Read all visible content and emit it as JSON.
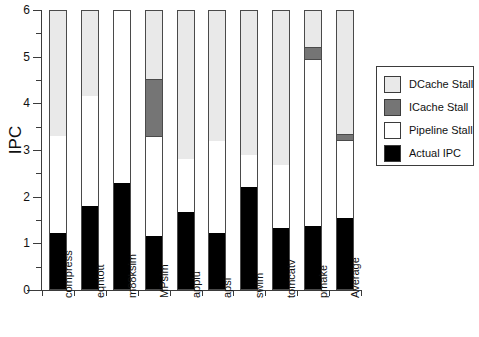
{
  "chart_data": {
    "type": "bar",
    "stacked": true,
    "title": "",
    "subtitle": "",
    "xlabel": "",
    "ylabel": "IPC",
    "ylim": [
      0,
      6
    ],
    "ytick_labels": [
      "0",
      "1",
      "2",
      "3",
      "4",
      "5",
      "6"
    ],
    "ytick_values": [
      0,
      1,
      2,
      3,
      4,
      5,
      6
    ],
    "minor_ticks": true,
    "grid": false,
    "legend_position": "right",
    "categories": [
      "compress",
      "eqntott",
      "m88ksim",
      "MPsim",
      "applu",
      "apsi",
      "swim",
      "tomcatv",
      "pmake",
      "Average"
    ],
    "series": [
      {
        "name": "Actual IPC",
        "color": "#000000",
        "values": [
          1.22,
          1.8,
          2.3,
          1.15,
          1.68,
          1.22,
          2.2,
          1.32,
          1.38,
          1.55
        ]
      },
      {
        "name": "Pipeline Stall",
        "color": "#ffffff",
        "values": [
          2.08,
          2.35,
          3.7,
          2.12,
          1.12,
          1.98,
          0.7,
          1.36,
          3.55,
          1.65
        ]
      },
      {
        "name": "ICache Stall",
        "color": "#757575",
        "values": [
          0.0,
          0.0,
          0.0,
          1.25,
          0.0,
          0.0,
          0.0,
          0.0,
          0.27,
          0.15
        ]
      },
      {
        "name": "DCache Stall",
        "color": "#e9e9e9",
        "values": [
          2.7,
          1.85,
          0.0,
          1.48,
          3.2,
          2.8,
          3.1,
          3.32,
          0.8,
          2.65
        ]
      }
    ],
    "cumulative_tops": {
      "compress": [
        1.22,
        3.3,
        3.3,
        6.0
      ],
      "eqntott": [
        1.8,
        4.15,
        4.15,
        6.0
      ],
      "m88ksim": [
        2.3,
        6.0,
        6.0,
        6.0
      ],
      "MPsim": [
        1.15,
        3.27,
        4.52,
        6.0
      ],
      "applu": [
        1.68,
        2.8,
        2.8,
        6.0
      ],
      "apsi": [
        1.22,
        3.2,
        3.2,
        6.0
      ],
      "swim": [
        2.2,
        2.9,
        2.9,
        6.0
      ],
      "tomcatv": [
        1.32,
        2.68,
        2.68,
        6.0
      ],
      "pmake": [
        1.38,
        4.93,
        5.2,
        6.0
      ],
      "Average": [
        1.55,
        3.2,
        3.35,
        6.0
      ]
    }
  },
  "legend": {
    "items": [
      {
        "label": "DCache Stall",
        "color": "#e9e9e9",
        "swatch": "dcache-swatch"
      },
      {
        "label": "ICache Stall",
        "color": "#757575",
        "swatch": "icache-swatch"
      },
      {
        "label": "Pipeline Stall",
        "color": "#ffffff",
        "swatch": "pipeline-swatch"
      },
      {
        "label": "Actual IPC",
        "color": "#000000",
        "swatch": "actual-swatch"
      }
    ]
  },
  "axes": {
    "y_title": "IPC"
  }
}
